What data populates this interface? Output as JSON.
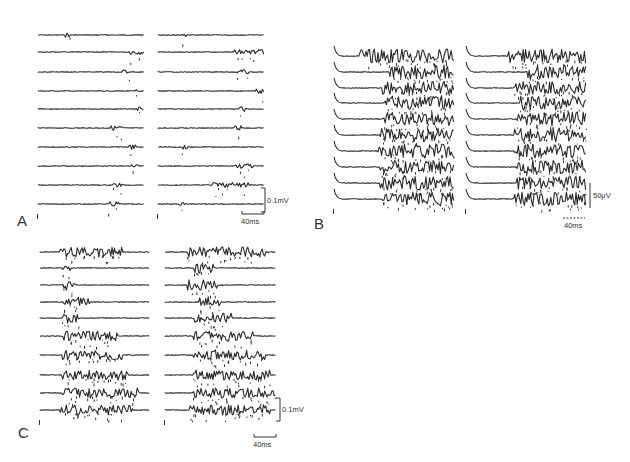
{
  "figure": {
    "panels": [
      {
        "id": "A",
        "label": "A",
        "traces_per_column": 10,
        "columns": 2,
        "activity": "sparse",
        "scale_bars": {
          "voltage": "0.1mV",
          "time": "40ms"
        }
      },
      {
        "id": "B",
        "label": "B",
        "traces_per_column": 10,
        "columns": 2,
        "activity": "dense",
        "scale_bars": {
          "voltage": "50μV",
          "time": "40ms"
        }
      },
      {
        "id": "C",
        "label": "C",
        "traces_per_column": 10,
        "columns": 2,
        "activity": "burst",
        "scale_bars": {
          "voltage": "0.1mV",
          "time": "40ms"
        }
      }
    ]
  }
}
